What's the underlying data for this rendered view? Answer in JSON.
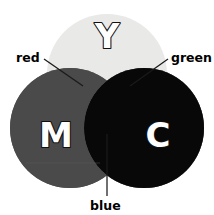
{
  "diagram": {
    "canvas": {
      "width": 214,
      "height": 215,
      "background": "#ffffff"
    },
    "rendering_note": "grayscale reproduction of a color figure",
    "primaries": [
      {
        "key": "yellow",
        "letter": "Y",
        "name": "Yellow",
        "fill": "#e9e9e7",
        "letter_fill": "#ffffff",
        "letter_outline": "#101010",
        "cx": 107,
        "cy": 74,
        "r": 60,
        "letter_x": 107,
        "letter_y": 36
      },
      {
        "key": "magenta",
        "letter": "M",
        "name": "Magenta",
        "fill": "#5a5a5a",
        "letter_fill": "#ffffff",
        "letter_outline": "#101010",
        "cx": 70,
        "cy": 128,
        "r": 60,
        "letter_x": 56,
        "letter_y": 135
      },
      {
        "key": "cyan",
        "letter": "C",
        "name": "Cyan",
        "fill": "#a8a8a8",
        "letter_fill": "#ffffff",
        "letter_outline": "#101010",
        "cx": 144,
        "cy": 128,
        "r": 60,
        "letter_x": 158,
        "letter_y": 135
      }
    ],
    "intersections": [
      {
        "key": "red",
        "label": "red",
        "made_from": "Yellow + Magenta",
        "fill": "#4a4a4a",
        "label_x": 16,
        "label_y": 62,
        "leader": {
          "x1": 44,
          "y1": 59,
          "x2": 83,
          "y2": 86
        }
      },
      {
        "key": "green",
        "label": "green",
        "made_from": "Yellow + Cyan",
        "fill": "#969696",
        "label_x": 171,
        "label_y": 62,
        "leader": {
          "x1": 168,
          "y1": 59,
          "x2": 130,
          "y2": 86
        }
      },
      {
        "key": "blue",
        "label": "blue",
        "made_from": "Magenta + Cyan",
        "fill": "#555555",
        "label_x": 90,
        "label_y": 210,
        "leader": {
          "x1": 107,
          "y1": 196,
          "x2": 107,
          "y2": 134
        }
      }
    ],
    "center": {
      "key": "black",
      "label": "",
      "made_from": "Yellow + Magenta + Cyan",
      "fill": "#080808"
    },
    "artifact_line": {
      "x1": 26,
      "y1": 163,
      "x2": 100,
      "y2": 163
    }
  }
}
